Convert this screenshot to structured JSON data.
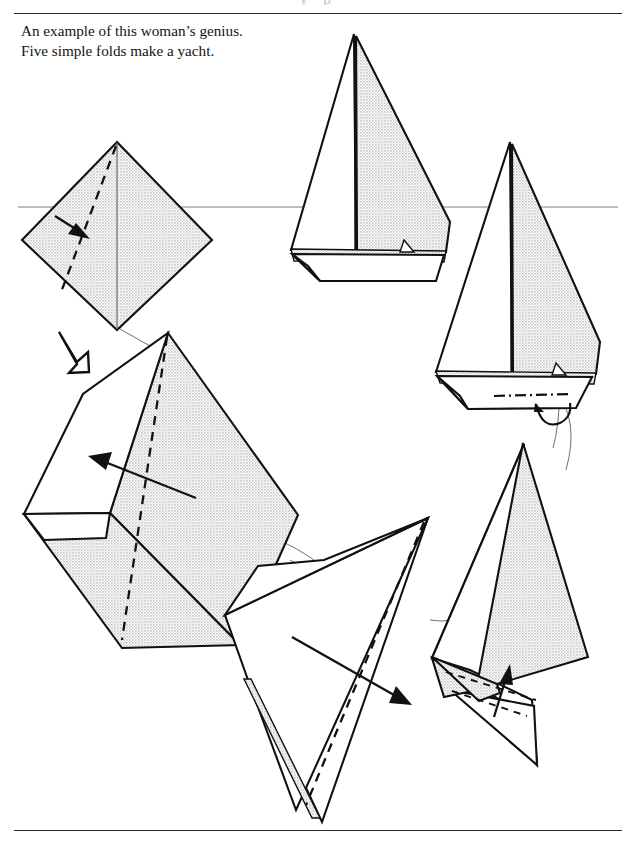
{
  "page": {
    "width": 636,
    "height": 845,
    "background_color": "#ffffff",
    "ink_color": "#111111",
    "shade_color": "#dcdcdc",
    "running_head_faint": "y p"
  },
  "rules": {
    "top_y": 13,
    "bottom_y": 830,
    "color": "#2b2b2b"
  },
  "caption": {
    "line1": "An example of this woman’s genius.",
    "line2": "Five simple folds make a yacht."
  },
  "horizon": {
    "label": "horizon-line",
    "y": 207,
    "color": "#6d6d6d"
  },
  "steps": [
    {
      "id": "step-1",
      "name": "square-base-diamond",
      "description": "Shaded square turned on point with vertical centre crease, valley fold dashed line from top vertex to lower-left, arrow pointing down-right.",
      "fold_type": "valley",
      "arrow_direction": "down-right"
    },
    {
      "id": "step-2",
      "name": "kite-with-flap",
      "description": "Tilted shaded kite with a white folded-back flap on the left side, dashed valley crease down the middle, arrow pointing up-left.",
      "fold_type": "valley",
      "arrow_direction": "up-left"
    },
    {
      "id": "step-3",
      "name": "white-triangle-fold",
      "description": "Rotated white triangle with a thin shaded sliver on the left edge, dashed valley crease, arrow pointing down-right.",
      "fold_type": "valley",
      "arrow_direction": "down-right"
    },
    {
      "id": "step-4",
      "name": "sail-forming",
      "description": "Shaded mainsail triangle with white jib behind and a hull flap below, dashed crease with arrow pointing up.",
      "fold_type": "valley",
      "arrow_direction": "up"
    },
    {
      "id": "step-5",
      "name": "yacht-with-keel",
      "description": "Completed yacht seen with hull, shaded mainsail, white jib, dash-dot waterline on the hull and a curved keel.",
      "fold_type": "none",
      "arrow_direction": "none"
    },
    {
      "id": "step-6",
      "name": "finished-yacht",
      "description": "Finished paper yacht: white jib, shaded mainsail, mast and open hull, sitting on the horizon line.",
      "fold_type": "none",
      "arrow_direction": "none"
    }
  ],
  "symbols": {
    "turn_over": {
      "name": "turn-over-arrow",
      "description": "Hollow outlined arrow indicating turn the model over"
    }
  }
}
